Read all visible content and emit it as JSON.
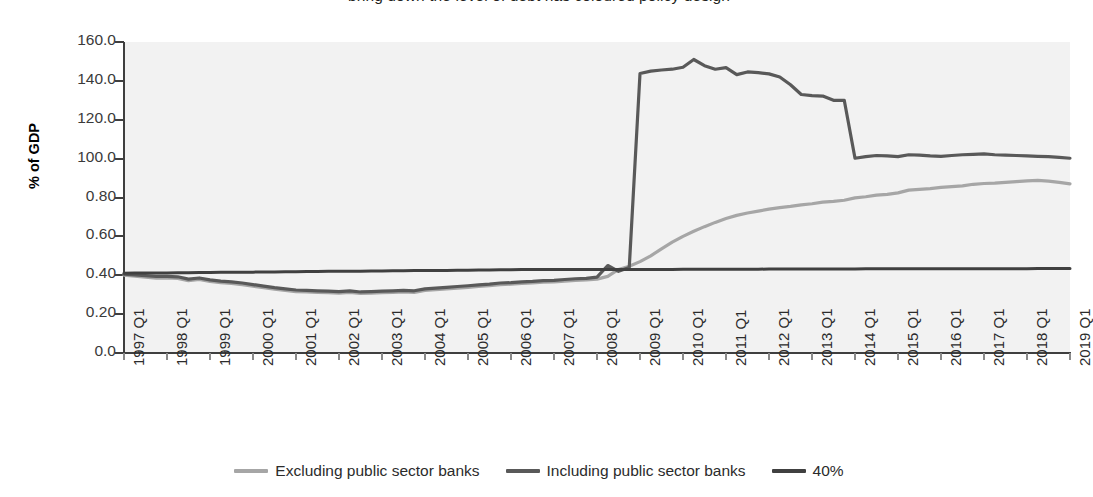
{
  "title": "bring down the level of debt has coloured policy design",
  "axes": {
    "ylabel": "% of GDP",
    "yticks": [
      "160.0",
      "140.0",
      "120.0",
      "100.0",
      "0.80",
      "0.60",
      "0.40",
      "0.20",
      "0.0"
    ],
    "ymin": 0,
    "ymax": 160,
    "xticks": [
      "1997 Q1",
      "1998 Q1",
      "1999 Q1",
      "2000 Q1",
      "2001 Q1",
      "2002 Q1",
      "2003 Q1",
      "2004 Q1",
      "2005 Q1",
      "2006 Q1",
      "2007 Q1",
      "2008 Q1",
      "2009 Q1",
      "2010 Q1",
      "2011 Q1",
      "2012 Q1",
      "2013 Q1",
      "2014 Q1",
      "2015 Q1",
      "2016 Q1",
      "2017 Q1",
      "2018 Q1",
      "2019 Q1"
    ]
  },
  "legend": {
    "items": [
      {
        "label": "Excluding public sector banks",
        "color": "#a6a6a6"
      },
      {
        "label": "Including public sector banks",
        "color": "#595959"
      },
      {
        "label": "40%",
        "color": "#404040"
      }
    ]
  },
  "colors": {
    "plot_background": "#f2f2f2",
    "axis": "#3f3f3f",
    "excluding": "#a6a6a6",
    "including": "#595959",
    "reference": "#404040"
  },
  "chart_data": {
    "type": "line",
    "title": "bring down the level of debt has coloured policy design",
    "xlabel": "",
    "ylabel": "% of GDP",
    "ylim": [
      0,
      160
    ],
    "grid": false,
    "legend_position": "bottom",
    "x": [
      "1997 Q1",
      "1997 Q2",
      "1997 Q3",
      "1997 Q4",
      "1998 Q1",
      "1998 Q2",
      "1998 Q3",
      "1998 Q4",
      "1999 Q1",
      "1999 Q2",
      "1999 Q3",
      "1999 Q4",
      "2000 Q1",
      "2000 Q2",
      "2000 Q3",
      "2000 Q4",
      "2001 Q1",
      "2001 Q2",
      "2001 Q3",
      "2001 Q4",
      "2002 Q1",
      "2002 Q2",
      "2002 Q3",
      "2002 Q4",
      "2003 Q1",
      "2003 Q2",
      "2003 Q3",
      "2003 Q4",
      "2004 Q1",
      "2004 Q2",
      "2004 Q3",
      "2004 Q4",
      "2005 Q1",
      "2005 Q2",
      "2005 Q3",
      "2005 Q4",
      "2006 Q1",
      "2006 Q2",
      "2006 Q3",
      "2006 Q4",
      "2007 Q1",
      "2007 Q2",
      "2007 Q3",
      "2007 Q4",
      "2008 Q1",
      "2008 Q2",
      "2008 Q3",
      "2008 Q4",
      "2009 Q1",
      "2009 Q2",
      "2009 Q3",
      "2009 Q4",
      "2010 Q1",
      "2010 Q2",
      "2010 Q3",
      "2010 Q4",
      "2011 Q1",
      "2011 Q2",
      "2011 Q3",
      "2011 Q4",
      "2012 Q1",
      "2012 Q2",
      "2012 Q3",
      "2012 Q4",
      "2013 Q1",
      "2013 Q2",
      "2013 Q3",
      "2013 Q4",
      "2014 Q1",
      "2014 Q2",
      "2014 Q3",
      "2014 Q4",
      "2015 Q1",
      "2015 Q2",
      "2015 Q3",
      "2015 Q4",
      "2016 Q1",
      "2016 Q2",
      "2016 Q3",
      "2016 Q4",
      "2017 Q1",
      "2017 Q2",
      "2017 Q3",
      "2017 Q4",
      "2018 Q1",
      "2018 Q2",
      "2018 Q3",
      "2018 Q4",
      "2019 Q1"
    ],
    "series": [
      {
        "name": "Excluding public sector banks",
        "color": "#a6a6a6",
        "values": [
          40.0,
          39.5,
          39.0,
          38.5,
          38.6,
          38.4,
          37.2,
          37.8,
          36.8,
          36.2,
          35.8,
          35.2,
          34.4,
          33.6,
          32.8,
          32.2,
          31.6,
          31.4,
          31.2,
          31.0,
          30.8,
          31.2,
          30.6,
          30.8,
          31.0,
          31.2,
          31.4,
          31.2,
          32.2,
          32.6,
          33.0,
          33.4,
          33.8,
          34.2,
          34.6,
          35.2,
          35.4,
          35.8,
          36.0,
          36.4,
          36.6,
          37.0,
          37.4,
          37.6,
          38.0,
          39.4,
          43.0,
          44.6,
          47.0,
          50.0,
          53.6,
          57.0,
          60.0,
          62.6,
          65.0,
          67.2,
          69.2,
          70.8,
          72.0,
          73.0,
          74.0,
          74.8,
          75.4,
          76.2,
          76.8,
          77.6,
          78.0,
          78.6,
          79.8,
          80.4,
          81.2,
          81.6,
          82.4,
          83.8,
          84.2,
          84.6,
          85.2,
          85.6,
          86.0,
          86.8,
          87.2,
          87.4,
          87.8,
          88.2,
          88.6,
          88.8,
          88.4,
          87.8,
          87.0
        ]
      },
      {
        "name": "Including public sector banks",
        "color": "#595959",
        "values": [
          40.6,
          40.2,
          39.8,
          39.4,
          39.4,
          39.2,
          38.0,
          38.6,
          37.6,
          37.0,
          36.6,
          36.0,
          35.2,
          34.4,
          33.6,
          33.0,
          32.4,
          32.2,
          32.0,
          31.8,
          31.6,
          32.0,
          31.4,
          31.6,
          31.8,
          32.0,
          32.2,
          32.0,
          33.0,
          33.4,
          33.8,
          34.2,
          34.6,
          35.0,
          35.4,
          36.0,
          36.2,
          36.6,
          36.8,
          37.2,
          37.4,
          37.8,
          38.2,
          38.4,
          39.0,
          45.0,
          42.0,
          44.0,
          143.8,
          145.0,
          145.6,
          146.0,
          147.0,
          151.0,
          147.8,
          146.0,
          146.8,
          143.2,
          144.6,
          144.2,
          143.6,
          142.0,
          138.0,
          133.0,
          132.4,
          132.2,
          130.0,
          130.0,
          100.2,
          101.0,
          101.6,
          101.4,
          101.0,
          102.0,
          101.8,
          101.4,
          101.2,
          101.6,
          102.0,
          102.2,
          102.4,
          102.0,
          101.8,
          101.6,
          101.4,
          101.2,
          101.0,
          100.6,
          100.2
        ]
      },
      {
        "name": "40%",
        "color": "#404040",
        "constant": true,
        "values": [
          41.0,
          41.1,
          41.1,
          41.2,
          41.2,
          41.3,
          41.3,
          41.4,
          41.4,
          41.5,
          41.5,
          41.6,
          41.6,
          41.7,
          41.7,
          41.8,
          41.8,
          41.9,
          41.9,
          42.0,
          42.0,
          42.1,
          42.1,
          42.2,
          42.2,
          42.3,
          42.3,
          42.4,
          42.4,
          42.5,
          42.5,
          42.6,
          42.6,
          42.7,
          42.7,
          42.8,
          42.8,
          42.9,
          42.9,
          43.0,
          43.0,
          43.0,
          43.0,
          43.0,
          43.0,
          43.0,
          43.0,
          43.0,
          43.0,
          43.0,
          43.0,
          43.0,
          43.1,
          43.1,
          43.1,
          43.1,
          43.1,
          43.1,
          43.1,
          43.1,
          43.2,
          43.2,
          43.2,
          43.2,
          43.2,
          43.2,
          43.2,
          43.2,
          43.2,
          43.3,
          43.3,
          43.3,
          43.3,
          43.3,
          43.3,
          43.3,
          43.3,
          43.4,
          43.4,
          43.4,
          43.4,
          43.4,
          43.4,
          43.4,
          43.4,
          43.5,
          43.5,
          43.5,
          43.5
        ]
      }
    ]
  }
}
